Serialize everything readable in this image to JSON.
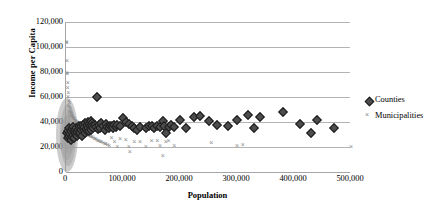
{
  "chart_data": {
    "type": "scatter",
    "title": "",
    "xlabel": "Population",
    "ylabel": "Income per Capita",
    "xlim": [
      0,
      500000
    ],
    "ylim": [
      0,
      120000
    ],
    "x_ticks": [
      0,
      100000,
      200000,
      300000,
      400000,
      500000
    ],
    "x_tick_labels": [
      "0",
      "100,000",
      "200,000",
      "300,000",
      "400,000",
      "500,000"
    ],
    "y_ticks": [
      0,
      20000,
      40000,
      60000,
      80000,
      100000,
      120000
    ],
    "y_tick_labels": [
      "0",
      "20,000",
      "40,000",
      "60,000",
      "80,000",
      "100,000",
      "120,000"
    ],
    "grid": "horizontal",
    "legend_position": "right",
    "series": [
      {
        "name": "Counties",
        "marker": "diamond",
        "color": "#4d4d4d",
        "points": [
          [
            2000,
            31000
          ],
          [
            3000,
            27500
          ],
          [
            4000,
            33000
          ],
          [
            5000,
            29000
          ],
          [
            6000,
            35000
          ],
          [
            7000,
            30500
          ],
          [
            8000,
            26000
          ],
          [
            9000,
            32500
          ],
          [
            10000,
            28000
          ],
          [
            11000,
            34500
          ],
          [
            12000,
            30000
          ],
          [
            13000,
            36000
          ],
          [
            14000,
            27000
          ],
          [
            15000,
            33500
          ],
          [
            16000,
            31500
          ],
          [
            17000,
            29500
          ],
          [
            18000,
            35500
          ],
          [
            19000,
            32000
          ],
          [
            20000,
            28500
          ],
          [
            21000,
            34000
          ],
          [
            22000,
            30500
          ],
          [
            23000,
            37000
          ],
          [
            24000,
            33000
          ],
          [
            25000,
            31000
          ],
          [
            26000,
            36500
          ],
          [
            27000,
            34000
          ],
          [
            28000,
            29000
          ],
          [
            29000,
            35000
          ],
          [
            30000,
            38000
          ],
          [
            31000,
            33500
          ],
          [
            32000,
            36000
          ],
          [
            33000,
            31500
          ],
          [
            34000,
            39000
          ],
          [
            35000,
            34500
          ],
          [
            36000,
            37500
          ],
          [
            37000,
            32500
          ],
          [
            38000,
            40000
          ],
          [
            39000,
            35500
          ],
          [
            40000,
            38500
          ],
          [
            41000,
            33000
          ],
          [
            42000,
            36500
          ],
          [
            43000,
            41000
          ],
          [
            44000,
            34000
          ],
          [
            45000,
            39500
          ],
          [
            46000,
            37000
          ],
          [
            48000,
            35000
          ],
          [
            50000,
            38000
          ],
          [
            52000,
            36000
          ],
          [
            55000,
            60000
          ],
          [
            56000,
            34500
          ],
          [
            58000,
            37500
          ],
          [
            60000,
            35500
          ],
          [
            62000,
            39000
          ],
          [
            65000,
            36500
          ],
          [
            68000,
            34000
          ],
          [
            70000,
            38500
          ],
          [
            72000,
            36000
          ],
          [
            75000,
            35000
          ],
          [
            78000,
            37000
          ],
          [
            80000,
            36500
          ],
          [
            82000,
            35500
          ],
          [
            85000,
            37500
          ],
          [
            88000,
            36000
          ],
          [
            90000,
            38000
          ],
          [
            95000,
            37000
          ],
          [
            100000,
            43000
          ],
          [
            105000,
            40000
          ],
          [
            110000,
            38500
          ],
          [
            115000,
            37000
          ],
          [
            120000,
            35500
          ],
          [
            125000,
            34000
          ],
          [
            130000,
            36000
          ],
          [
            140000,
            35000
          ],
          [
            145000,
            37000
          ],
          [
            150000,
            36500
          ],
          [
            155000,
            35500
          ],
          [
            160000,
            37000
          ],
          [
            165000,
            36000
          ],
          [
            170000,
            41000
          ],
          [
            172000,
            36500
          ],
          [
            175000,
            31000
          ],
          [
            180000,
            36000
          ],
          [
            185000,
            37500
          ],
          [
            190000,
            36000
          ],
          [
            200000,
            42000
          ],
          [
            210000,
            35500
          ],
          [
            225000,
            44000
          ],
          [
            235000,
            45000
          ],
          [
            250000,
            40500
          ],
          [
            265000,
            38000
          ],
          [
            285000,
            37000
          ],
          [
            300000,
            42000
          ],
          [
            320000,
            46000
          ],
          [
            330000,
            35500
          ],
          [
            340000,
            44000
          ],
          [
            380000,
            48000
          ],
          [
            410000,
            38500
          ],
          [
            430000,
            31000
          ],
          [
            440000,
            42000
          ],
          [
            470000,
            35500
          ]
        ]
      },
      {
        "name": "Municipalities",
        "marker": "x",
        "color": "#8c8c8c",
        "points": [
          [
            1000,
            105000
          ],
          [
            1500,
            104000
          ],
          [
            2000,
            90000
          ],
          [
            1800,
            80000
          ],
          [
            2200,
            79000
          ],
          [
            3000,
            72000
          ],
          [
            2500,
            68000
          ],
          [
            4000,
            64000
          ],
          [
            3500,
            61000
          ],
          [
            5000,
            58000
          ],
          [
            6000,
            56000
          ],
          [
            4500,
            54000
          ],
          [
            7000,
            52000
          ],
          [
            8000,
            50000
          ],
          [
            5500,
            49000
          ],
          [
            9000,
            48000
          ],
          [
            10000,
            47000
          ],
          [
            11000,
            46000
          ],
          [
            6500,
            45500
          ],
          [
            12000,
            45000
          ],
          [
            13000,
            44000
          ],
          [
            14000,
            43500
          ],
          [
            15000,
            43000
          ],
          [
            16000,
            42000
          ],
          [
            17000,
            41500
          ],
          [
            18000,
            41000
          ],
          [
            19000,
            40500
          ],
          [
            20000,
            40000
          ],
          [
            21000,
            39500
          ],
          [
            22000,
            39000
          ],
          [
            23000,
            38500
          ],
          [
            24000,
            38000
          ],
          [
            25000,
            37500
          ],
          [
            26000,
            37000
          ],
          [
            27000,
            36500
          ],
          [
            28000,
            36000
          ],
          [
            29000,
            35500
          ],
          [
            30000,
            35000
          ],
          [
            31000,
            34500
          ],
          [
            32000,
            34000
          ],
          [
            33000,
            33500
          ],
          [
            34000,
            33000
          ],
          [
            35000,
            32500
          ],
          [
            36000,
            32000
          ],
          [
            37000,
            31500
          ],
          [
            38000,
            31000
          ],
          [
            39000,
            30500
          ],
          [
            40000,
            30000
          ],
          [
            42000,
            29500
          ],
          [
            44000,
            29000
          ],
          [
            46000,
            28500
          ],
          [
            48000,
            28000
          ],
          [
            50000,
            27500
          ],
          [
            52000,
            27000
          ],
          [
            54000,
            26500
          ],
          [
            56000,
            26000
          ],
          [
            58000,
            25500
          ],
          [
            60000,
            25000
          ],
          [
            62000,
            24500
          ],
          [
            65000,
            24000
          ],
          [
            68000,
            23500
          ],
          [
            70000,
            23000
          ],
          [
            73000,
            22500
          ],
          [
            76000,
            22000
          ],
          [
            80000,
            28000
          ],
          [
            85000,
            25000
          ],
          [
            90000,
            21000
          ],
          [
            95000,
            27000
          ],
          [
            105000,
            26500
          ],
          [
            110000,
            21000
          ],
          [
            112000,
            17000
          ],
          [
            120000,
            25000
          ],
          [
            130000,
            24500
          ],
          [
            140000,
            21000
          ],
          [
            150000,
            26000
          ],
          [
            160000,
            25500
          ],
          [
            165000,
            21500
          ],
          [
            170000,
            14000
          ],
          [
            175000,
            25000
          ],
          [
            180000,
            26000
          ],
          [
            190000,
            22000
          ],
          [
            255000,
            24000
          ],
          [
            300000,
            21500
          ],
          [
            310000,
            22500
          ],
          [
            500000,
            21000
          ]
        ]
      }
    ]
  },
  "legend": {
    "items": [
      {
        "label": "Counties",
        "marker": "diamond"
      },
      {
        "label": "Municipalities",
        "marker": "x"
      }
    ]
  }
}
